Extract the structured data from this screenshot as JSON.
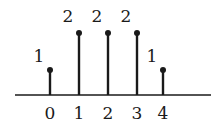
{
  "diagram": {
    "type": "stem-plot",
    "axis": {
      "x1": 15,
      "x2": 211,
      "y": 95,
      "color": "#1a1a1a"
    },
    "stems": [
      {
        "n": "0",
        "value": "1",
        "x": 50,
        "top": 70,
        "label_x": 39,
        "label_y": 62
      },
      {
        "n": "1",
        "value": "2",
        "x": 79,
        "top": 33,
        "label_x": 68,
        "label_y": 22
      },
      {
        "n": "2",
        "value": "2",
        "x": 108,
        "top": 33,
        "label_x": 97,
        "label_y": 22
      },
      {
        "n": "3",
        "value": "2",
        "x": 137,
        "top": 33,
        "label_x": 126,
        "label_y": 22
      },
      {
        "n": "4",
        "value": "1",
        "x": 163,
        "top": 70,
        "label_x": 152,
        "label_y": 62
      }
    ],
    "tick_label_y": 119
  }
}
